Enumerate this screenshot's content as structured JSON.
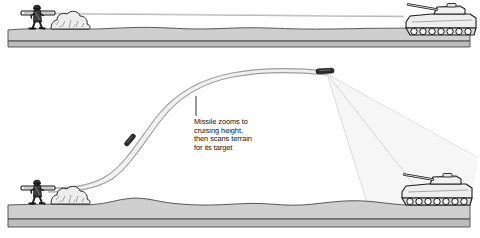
{
  "diagram": {
    "panels": [
      {
        "id": "panel-direct-fire",
        "name": "Direct line-of-sight panel",
        "caption": "",
        "elements": [
          "soldier-launcher",
          "bush",
          "line-of-sight",
          "target-tank",
          "ground-slab"
        ]
      },
      {
        "id": "panel-top-attack",
        "name": "Lofted trajectory panel",
        "caption": "",
        "elements": [
          "soldier-launcher",
          "bush",
          "missile-trajectory",
          "missile-ascending",
          "missile-apex",
          "scan-cone",
          "target-tank",
          "ground-slab"
        ]
      }
    ],
    "annotation": {
      "text": "Missile zooms to\ncruising height,\nthen scans terrain\nfor its target",
      "lines": [
        "Missile zooms to",
        "cruising height,",
        "then scans terrain",
        "for its target"
      ],
      "leader_label": "leader-line"
    },
    "labels": {
      "soldier": "soldier-with-launcher",
      "tank": "target-tank",
      "bush": "bush-shrub",
      "missile": "missile",
      "scan_cone": "terrain-scan-cone",
      "sight_line": "line-of-sight",
      "trajectory": "missile-trajectory",
      "ground": "ground-terrain"
    },
    "colors": {
      "ink": "#111111",
      "line": "#3a3a3a",
      "ground_top": "#d4d4d4",
      "ground_face": "#b9b9b9",
      "ground_outline": "#4a4a4a",
      "vehicle_body": "#e8e8e8",
      "vehicle_shade": "#a8a8a8",
      "missile_body": "#2b2b2b",
      "trajectory_fill": "#f2f2f2",
      "scan_fill": "#f4f4f4",
      "background": "#ffffff"
    }
  }
}
